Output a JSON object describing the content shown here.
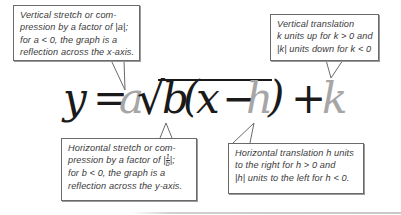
{
  "equation": {
    "y": "y",
    "equals": "=",
    "a": "a",
    "sqrt": "√",
    "b": "b",
    "open_paren": "(",
    "x": "x",
    "minus": "−",
    "h": "h",
    "close_paren": ")",
    "plus": "+",
    "k": "k",
    "colors": {
      "main": "#1a1a1a",
      "parameter": "#a6a6a6"
    }
  },
  "callouts": {
    "a": {
      "lines": [
        "Vertical stretch or com-",
        "pression by a factor of |a|;",
        "for a < 0, the graph is a",
        "reflection across the x-axis."
      ]
    },
    "k": {
      "lines": [
        "Vertical translation",
        "k units up for k > 0 and",
        "|k| units down for k < 0"
      ]
    },
    "b": {
      "lines": [
        "Horizontal stretch or com-",
        "pression by a factor of",
        "for b < 0, the graph is a",
        "reflection across the y-axis."
      ],
      "fraction": {
        "open": "|",
        "numerator": "1",
        "denominator": "b",
        "close": "|;"
      }
    },
    "h": {
      "lines": [
        "Horizontal translation h units",
        "to the right for h > 0 and",
        "|h| units to the left for h < 0."
      ]
    }
  }
}
